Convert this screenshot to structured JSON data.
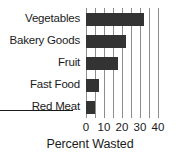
{
  "chart_data": {
    "type": "bar",
    "orientation": "horizontal",
    "title": "",
    "xlabel": "Percent Wasted",
    "ylabel": "",
    "categories": [
      "Vegetables",
      "Bakery Goods",
      "Fruit",
      "Fast Food",
      "Red Meat"
    ],
    "values": [
      32,
      22,
      18,
      7,
      5
    ],
    "xlim": [
      0,
      40
    ],
    "xticks": [
      0,
      10,
      20,
      30,
      40
    ],
    "xtick_labels": [
      "0",
      "10",
      "20",
      "30",
      "40"
    ],
    "minor_gridline_step": 5,
    "grid": true,
    "legend": false,
    "bar_color": "#333333",
    "gridline_color": "#8d8d8d",
    "axis_color": "#1a1a1a",
    "background": "#ffffff"
  }
}
